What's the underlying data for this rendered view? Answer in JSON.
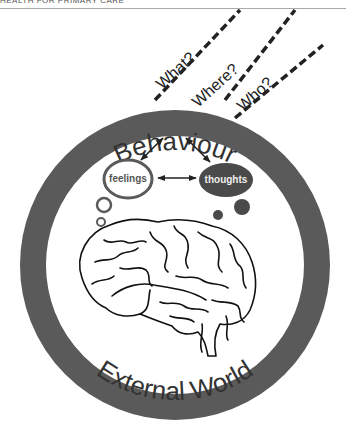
{
  "header": {
    "running_title": "HEALTH FOR PRIMARY CARE"
  },
  "diagram": {
    "ring": {
      "top_label": "Behaviour",
      "bottom_label": "External World",
      "color": "#5a5a5a"
    },
    "questions": [
      {
        "label": "What?"
      },
      {
        "label": "Where?"
      },
      {
        "label": "Who?"
      }
    ],
    "bubbles": {
      "feelings": {
        "label": "feelings",
        "style": "outline",
        "color": "#5a5a5a"
      },
      "thoughts": {
        "label": "thoughts",
        "style": "filled",
        "color": "#4a4a4a"
      }
    },
    "connections": [
      {
        "from": "Behaviour",
        "to": "feelings",
        "type": "bidirectional"
      },
      {
        "from": "Behaviour",
        "to": "thoughts",
        "type": "bidirectional"
      },
      {
        "from": "feelings",
        "to": "thoughts",
        "type": "bidirectional"
      }
    ],
    "central_image": "brain-illustration"
  }
}
